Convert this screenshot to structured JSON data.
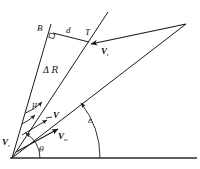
{
  "figure": {
    "type": "vector-geometry-diagram",
    "background_color": "#ffffff",
    "line_color": "#1a1a1a",
    "text_color": "#111111"
  },
  "labels": {
    "point_b": "B",
    "point_t": "T",
    "distance_d": "d",
    "delta_r": "Δ R",
    "delta_symbol": "Δ",
    "r_symbol": "R",
    "v_t": "V",
    "v_t_sub": "t",
    "v_plain": "V",
    "v_m": "V",
    "v_m_sub": "m",
    "v_r": "V",
    "v_r_sub": "r",
    "angle_mu": "μ",
    "angle_epsilon": "ε",
    "angle_theta": "θ"
  },
  "geometry": {
    "origin": {
      "x": 12,
      "y": 158
    },
    "ground_axis": {
      "x1": 10,
      "y1": 158,
      "x2": 196,
      "y2": 158
    },
    "apex_right": {
      "x": 186,
      "y": 24
    },
    "point_b": {
      "x": 52,
      "y": 31
    },
    "point_t": {
      "x": 88,
      "y": 43
    },
    "ray_b_top": {
      "x": 51,
      "y": 25
    },
    "ray_t_top": {
      "x": 108,
      "y": 13
    },
    "right_angle_marker": {
      "x": 52,
      "y": 34,
      "size": 4
    },
    "arc_theta_radius": 28,
    "arc_epsilon_radius": 62,
    "arc_mu_radius": 44
  },
  "annotations": {
    "right_angle_at_b": true,
    "arrowheads": [
      "v_t_arrow_toward_T",
      "v_m_arrow",
      "v_plain_arrow",
      "mu_arc_arrow",
      "epsilon_arc_arrow",
      "theta_arc_arrow"
    ]
  }
}
